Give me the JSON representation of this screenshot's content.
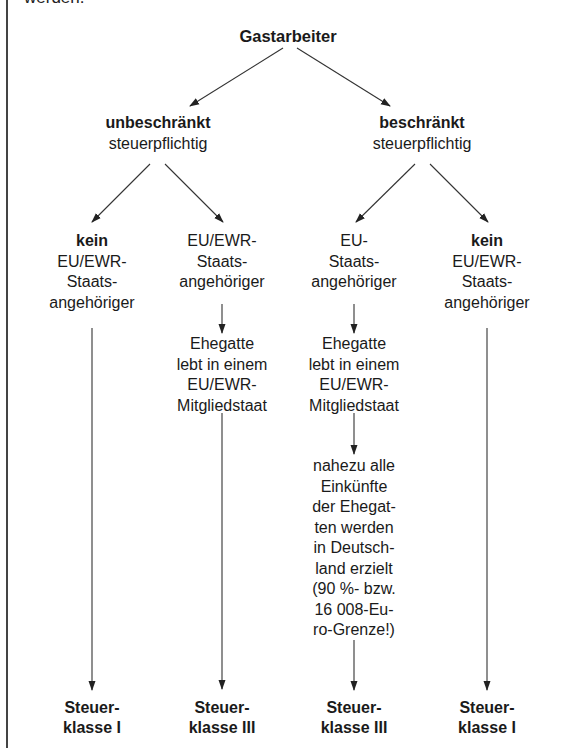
{
  "intro_text": "werden.",
  "root": {
    "label": "Gastarbeiter"
  },
  "branches": [
    {
      "title": "unbeschränkt",
      "subtitle": "steuerpflichtig"
    },
    {
      "title": "beschränkt",
      "subtitle": "steuerpflichtig"
    }
  ],
  "columns": [
    {
      "nationality": {
        "bold": "kein",
        "lines": [
          "EU/EWR-",
          "Staats-",
          "angehöriger"
        ]
      },
      "result": [
        "Steuer-",
        "klasse I"
      ]
    },
    {
      "nationality": {
        "bold": "",
        "lines": [
          "EU/EWR-",
          "Staats-",
          "angehöriger"
        ]
      },
      "condition": [
        "Ehegatte",
        "lebt in einem",
        "EU/EWR-",
        "Mitgliedstaat"
      ],
      "result": [
        "Steuer-",
        "klasse III"
      ]
    },
    {
      "nationality": {
        "bold": "",
        "lines": [
          "EU-",
          "Staats-",
          "angehöriger"
        ]
      },
      "condition": [
        "Ehegatte",
        "lebt in einem",
        "EU/EWR-",
        "Mitgliedstaat"
      ],
      "condition2": [
        "nahezu alle",
        "Einkünfte",
        "der Ehegat-",
        "ten werden",
        "in Deutsch-",
        "land erzielt",
        "(90 %- bzw.",
        "16 008-Eu-",
        "ro-Grenze!)"
      ],
      "result": [
        "Steuer-",
        "klasse III"
      ]
    },
    {
      "nationality": {
        "bold": "kein",
        "lines": [
          "EU/EWR-",
          "Staats-",
          "angehöriger"
        ]
      },
      "result": [
        "Steuer-",
        "klasse I"
      ]
    }
  ],
  "colors": {
    "text": "#1a1a1a",
    "line": "#333333",
    "background": "#ffffff"
  }
}
